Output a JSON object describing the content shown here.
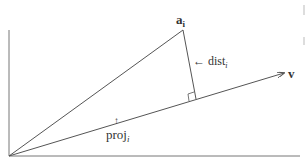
{
  "diagram": {
    "labels": {
      "point": "a",
      "point_sub": "i",
      "vector": "v",
      "distance": "← dist",
      "distance_sub": "i",
      "projection_arrow": "↑",
      "projection": "proj",
      "projection_sub": "i"
    },
    "colors": {
      "line": "#555555",
      "axis": "#777777",
      "text": "#333333",
      "edge_marks": "#bbbbbb"
    },
    "geometry": {
      "origin": [
        9,
        156
      ],
      "point_a": [
        183,
        30
      ],
      "foot": [
        196,
        99
      ],
      "vector_end": [
        284,
        73
      ],
      "x_axis_end": [
        300,
        156
      ],
      "y_axis_top": [
        9,
        30
      ]
    }
  }
}
